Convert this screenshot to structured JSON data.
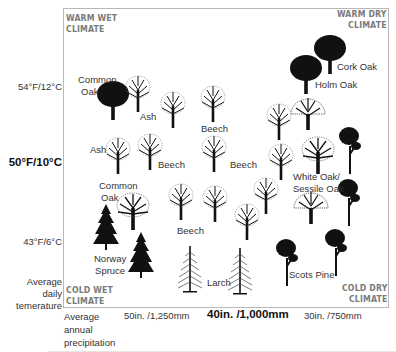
{
  "corners": {
    "top_left": [
      "WARM WET",
      "CLIMATE"
    ],
    "top_right": [
      "WARM DRY",
      "CLIMATE"
    ],
    "bottom_left": [
      "COLD WET",
      "CLIMATE"
    ],
    "bottom_right": [
      "COLD DRY",
      "CLIMATE"
    ]
  },
  "y_axis": {
    "ticks": [
      {
        "label": "54°F/12°C",
        "bold": false
      },
      {
        "label": "50°F/10°C",
        "bold": true
      },
      {
        "label": "43°F/6°C",
        "bold": false
      }
    ],
    "title": [
      "Average",
      "daily",
      "temerature"
    ]
  },
  "x_axis": {
    "title": [
      "Average",
      "annual",
      "precipitation"
    ],
    "ticks": [
      {
        "label": "50in. /1,250mm",
        "bold": false
      },
      {
        "label": "40in. /1,000mm",
        "bold": true
      },
      {
        "label": "30in. /750mm",
        "bold": false
      }
    ]
  },
  "tree_labels": {
    "common_oak_1": [
      "Common",
      "Oak"
    ],
    "ash_1": "Ash",
    "beech_1": "Beech",
    "ash_2": "Ash",
    "beech_2": "Beech",
    "beech_3": "Beech",
    "common_oak_2": [
      "Common",
      "Oak"
    ],
    "beech_4": "Beech",
    "norway_spruce": [
      "Norway",
      "Spruce"
    ],
    "larch": "Larch",
    "cork_oak": "Cork Oak",
    "holm_oak": "Holm Oak",
    "white_oak": [
      "White Oak/",
      "Sessile Oak"
    ],
    "scots_pine": "Scots Pine"
  },
  "colors": {
    "border": "#b8b8b8",
    "corner_text": "#7a7a7a",
    "tree_fill": "#111111"
  }
}
